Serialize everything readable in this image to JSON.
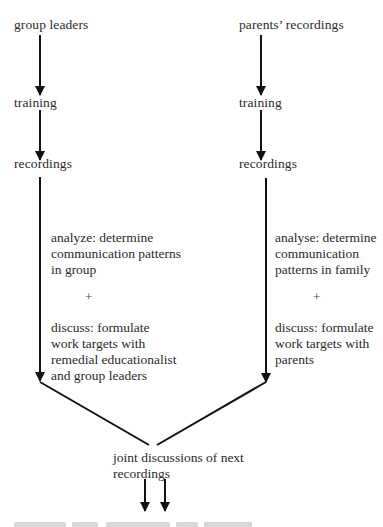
{
  "diagram": {
    "type": "flowchart",
    "left_branch": {
      "steps": [
        "group leaders",
        "training",
        "recordings"
      ],
      "analyze": [
        "analyze: determine",
        "communication patterns",
        "in group"
      ],
      "plus": "+",
      "discuss": [
        "discuss: formulate",
        "work targets with",
        "remedial educationalist",
        "and group leaders"
      ]
    },
    "right_branch": {
      "steps": [
        "parents’ recordings",
        "training",
        "recordings"
      ],
      "analyze": [
        "analyse: determine",
        "communication",
        "patterns in family"
      ],
      "plus": "+",
      "discuss": [
        "discuss: formulate",
        "work targets with",
        "parents"
      ]
    },
    "merge": {
      "label": [
        "joint discussions of next",
        "recordings"
      ],
      "outgoing_arrows": 2
    },
    "colors": {
      "line": "#111111",
      "text": "#2a2a2a",
      "background": "#ffffff"
    }
  }
}
